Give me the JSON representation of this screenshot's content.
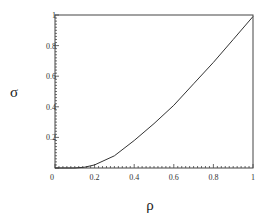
{
  "chart_data": {
    "type": "line",
    "title": "",
    "xlabel": "ρ",
    "ylabel": "σ",
    "xlim": [
      0,
      1
    ],
    "ylim": [
      0,
      1
    ],
    "grid": false,
    "legend": null,
    "x_ticks": [
      "0",
      "0.2",
      "0.4",
      "0.6",
      "0.8",
      "1"
    ],
    "y_ticks": [
      "0.2",
      "0.4",
      "0.6",
      "0.8",
      "1"
    ],
    "series": [
      {
        "name": "σ(ρ)",
        "color": "#333333",
        "x": [
          0,
          0.1,
          0.15,
          0.2,
          0.3,
          0.4,
          0.5,
          0.6,
          0.7,
          0.8,
          0.9,
          1.0
        ],
        "y": [
          0,
          0,
          0.005,
          0.02,
          0.08,
          0.18,
          0.29,
          0.41,
          0.55,
          0.69,
          0.84,
          0.99
        ]
      }
    ]
  },
  "layout": {
    "plot_left": 55,
    "plot_right": 253,
    "plot_top": 15,
    "plot_bottom": 168
  }
}
